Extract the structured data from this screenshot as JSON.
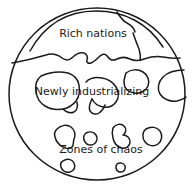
{
  "diagram": {
    "type": "conceptual-zone-diagram",
    "title": "",
    "shape": "circle",
    "colors": {
      "stroke": "#1a1a1a",
      "background": "#ffffff",
      "text": "#1a1a1a"
    },
    "labels": [
      {
        "id": "rich-nations",
        "text": "Rich nations",
        "x": 93,
        "y": 37,
        "font_size": 11
      },
      {
        "id": "newly-industrializing",
        "text": "Newly industrializing",
        "x": 92,
        "y": 95,
        "font_size": 11
      },
      {
        "id": "zones-of-chaos",
        "text": "Zones of chaos",
        "x": 101,
        "y": 153,
        "font_size": 11
      }
    ],
    "outer_circle": {
      "id": "world-boundary",
      "cx": 97,
      "cy": 94,
      "rx": 88,
      "ry": 86
    },
    "boundary_lines": [
      {
        "id": "rich-nations-upper-arc",
        "path": "M 30 51 C 45 24 68 11 96 11 C 124 11 148 23 163 47"
      },
      {
        "id": "rich-nations-lower-boundary",
        "path": "M 12 63 C 24 61 36 58 46 55 C 52 53 58 55 62 58 C 66 61 70 60 73 57 C 76 54 80 52 84 53 C 87 54 88 57 87 60 C 86 62 88 64 91 63 C 94 62 97 59 100 56 C 103 53 106 54 108 57 C 110 60 113 61 117 59 C 121 57 126 57 130 59 C 134 61 139 61 144 59 C 150 57 157 56 163 57 C 169 58 175 59 180 58"
      },
      {
        "id": "rich-nations-right-notch",
        "path": "M 117 12 C 120 17 123 21 127 23 C 131 25 134 28 135 32"
      },
      {
        "id": "rich-nations-inner-divider",
        "path": "M 133 33 C 135 39 137 44 139 49 C 140 53 141 57 140 60"
      }
    ],
    "blobs": [
      {
        "id": "ni-blob-left",
        "label_zone": "newly-industrializing",
        "path": "M 41 76 C 50 72 60 71 68 73 C 74 75 78 79 79 85 C 80 91 79 97 76 101 C 73 105 68 108 63 109 C 57 110 50 109 45 106 C 40 103 37 98 36 92 C 35 86 36 80 41 76 Z"
      },
      {
        "id": "ni-blob-left-tail",
        "label_zone": "newly-industrializing",
        "path": "M 63 109 C 66 112 70 114 74 112 C 77 110 78 106 77 102"
      },
      {
        "id": "ni-blob-center",
        "label_zone": "newly-industrializing",
        "path": "M 86 82 C 90 78 96 77 102 78 C 108 79 113 82 116 87 C 119 92 119 98 116 102 C 113 106 108 108 103 107 C 98 106 94 103 92 99"
      },
      {
        "id": "ni-blob-center-tail",
        "label_zone": "newly-industrializing",
        "path": "M 92 99 C 90 103 88 107 90 111 C 92 114 96 115 99 113 C 102 111 104 108 105 105"
      },
      {
        "id": "ni-blob-oval-upper",
        "label_zone": "newly-industrializing",
        "path": "M 126 73 C 131 69 138 69 143 72 C 148 75 150 81 148 86 C 146 91 140 94 134 93 C 128 92 124 88 124 82 C 124 79 125 76 126 73 Z"
      },
      {
        "id": "ni-blob-right-edge",
        "label_zone": "newly-industrializing",
        "path": "M 184 70 C 176 70 168 72 163 77 C 158 82 157 89 160 94 C 163 99 170 102 177 101 C 181 100 184 99 186 97"
      },
      {
        "id": "chaos-blob-1",
        "label_zone": "zones-of-chaos",
        "path": "M 57 129 C 61 125 67 124 71 127 C 75 130 76 135 74 139 C 73 142 74 145 72 147 C 70 149 66 149 63 147 C 59 145 56 141 55 137 C 54 134 55 131 57 129 Z"
      },
      {
        "id": "chaos-blob-2",
        "label_zone": "zones-of-chaos",
        "path": "M 86 133 C 90 131 94 132 96 135 C 98 138 97 142 94 144 C 91 146 87 145 85 142 C 83 139 83 135 86 133 Z"
      },
      {
        "id": "chaos-blob-3",
        "label_zone": "zones-of-chaos",
        "path": "M 113 128 C 116 124 121 123 124 126 C 127 129 126 133 123 135 C 127 135 130 138 130 142 C 130 146 126 149 122 148 C 117 147 114 143 113 138 C 112 134 112 131 113 128 Z"
      },
      {
        "id": "chaos-blob-4",
        "label_zone": "zones-of-chaos",
        "path": "M 146 129 C 151 126 157 127 160 131 C 163 135 162 141 158 144 C 154 147 148 146 145 142 C 142 138 142 132 146 129 Z"
      },
      {
        "id": "chaos-blob-5",
        "label_zone": "zones-of-chaos",
        "path": "M 63 161 C 67 158 72 159 74 163 C 76 167 74 171 70 172 C 66 173 62 171 61 167 C 60 164 61 162 63 161 Z"
      },
      {
        "id": "chaos-blob-6",
        "label_zone": "zones-of-chaos",
        "path": "M 117 164 C 120 162 124 163 125 166 C 126 169 124 172 121 172 C 118 172 116 170 116 167 C 116 166 116 165 117 164 Z"
      }
    ]
  }
}
